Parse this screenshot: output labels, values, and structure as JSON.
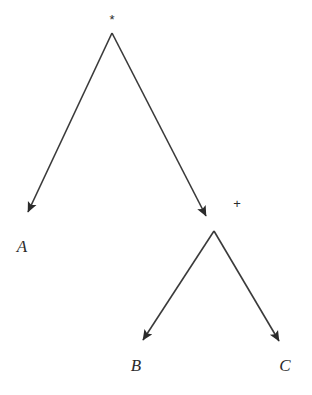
{
  "figure": {
    "kind": "expression-tree",
    "background_color": "#ffffff",
    "stroke_color": "#3a3a3a",
    "text_color": "#2b2b2b",
    "width": 312,
    "height": 395
  },
  "nodes": [
    {
      "id": "root",
      "label": "*",
      "role": "operator",
      "label_x": 112,
      "label_y": 19,
      "point_x": 112,
      "point_y": 33
    },
    {
      "id": "leaf-a",
      "label": "A",
      "role": "operand",
      "label_x": 22,
      "label_y": 247,
      "point_x": 23,
      "point_y": 222
    },
    {
      "id": "plus",
      "label": "+",
      "role": "operator",
      "label_x": 237,
      "label_y": 203,
      "point_x": 212,
      "point_y": 228
    },
    {
      "id": "leaf-b",
      "label": "B",
      "role": "operand",
      "label_x": 136,
      "label_y": 366,
      "point_x": 137,
      "point_y": 350
    },
    {
      "id": "leaf-c",
      "label": "C",
      "role": "operand",
      "label_x": 285,
      "label_y": 366,
      "point_x": 285,
      "point_y": 351
    }
  ],
  "edges": [
    {
      "id": "edge-root-a",
      "from": "root",
      "to": "leaf-a",
      "x1": 112,
      "y1": 33,
      "x2": 28,
      "y2": 212
    },
    {
      "id": "edge-root-plus",
      "from": "root",
      "to": "plus",
      "x1": 112,
      "y1": 33,
      "x2": 206,
      "y2": 216
    },
    {
      "id": "edge-plus-b",
      "from": "plus",
      "to": "leaf-b",
      "x1": 214,
      "y1": 231,
      "x2": 143,
      "y2": 340
    },
    {
      "id": "edge-plus-c",
      "from": "plus",
      "to": "leaf-c",
      "x1": 214,
      "y1": 231,
      "x2": 279,
      "y2": 341
    }
  ]
}
